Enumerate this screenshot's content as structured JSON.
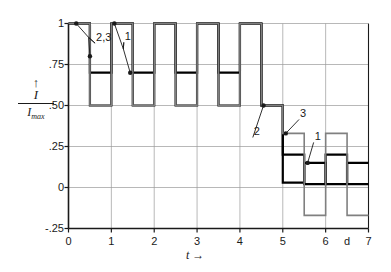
{
  "chart_data": {
    "type": "line",
    "title": "",
    "xlabel": "t",
    "ylabel": "I / Imax",
    "xlim": [
      0,
      7
    ],
    "ylim": [
      -0.25,
      1.0
    ],
    "grid": true,
    "legend": "none",
    "x_ticks": [
      "0",
      "1",
      "2",
      "3",
      "4",
      "5",
      "6",
      "7"
    ],
    "x_tick_values": [
      0,
      1,
      2,
      3,
      4,
      5,
      6,
      7
    ],
    "x_unit_label": "d",
    "x_unit_label_value": 6.5,
    "y_ticks": [
      "1",
      ".75",
      ".50",
      ".25",
      "0",
      "-.25"
    ],
    "y_tick_values": [
      1,
      0.75,
      0.5,
      0.25,
      0,
      -0.25
    ],
    "series": [
      {
        "name": "1",
        "color": "#000000",
        "width": 2.2,
        "points": [
          [
            0.0,
            1.0
          ],
          [
            0.5,
            1.0
          ],
          [
            0.5,
            0.7
          ],
          [
            1.0,
            0.7
          ],
          [
            1.0,
            1.0
          ],
          [
            1.5,
            1.0
          ],
          [
            1.5,
            0.7
          ],
          [
            2.0,
            0.7
          ],
          [
            2.0,
            1.0
          ],
          [
            2.5,
            1.0
          ],
          [
            2.5,
            0.7
          ],
          [
            3.0,
            0.7
          ],
          [
            3.0,
            1.0
          ],
          [
            3.5,
            1.0
          ],
          [
            3.5,
            0.7
          ],
          [
            4.0,
            0.7
          ],
          [
            4.0,
            1.0
          ],
          [
            4.5,
            1.0
          ],
          [
            4.5,
            0.5
          ],
          [
            5.0,
            0.5
          ],
          [
            5.0,
            0.03
          ],
          [
            5.5,
            0.03
          ],
          [
            5.5,
            0.15
          ],
          [
            6.0,
            0.15
          ],
          [
            6.0,
            0.02
          ],
          [
            6.5,
            0.02
          ],
          [
            6.5,
            0.15
          ],
          [
            7.0,
            0.15
          ]
        ]
      },
      {
        "name": "2",
        "color": "#000000",
        "width": 2.2,
        "points": [
          [
            0.0,
            1.0
          ],
          [
            0.5,
            1.0
          ],
          [
            0.5,
            0.5
          ],
          [
            1.0,
            0.5
          ],
          [
            1.0,
            1.0
          ],
          [
            1.5,
            1.0
          ],
          [
            1.5,
            0.5
          ],
          [
            2.0,
            0.5
          ],
          [
            2.0,
            1.0
          ],
          [
            2.5,
            1.0
          ],
          [
            2.5,
            0.5
          ],
          [
            3.0,
            0.5
          ],
          [
            3.0,
            1.0
          ],
          [
            3.5,
            1.0
          ],
          [
            3.5,
            0.5
          ],
          [
            4.0,
            0.5
          ],
          [
            4.0,
            1.0
          ],
          [
            4.5,
            1.0
          ],
          [
            4.5,
            0.5
          ],
          [
            5.0,
            0.5
          ],
          [
            5.0,
            0.2
          ],
          [
            5.5,
            0.2
          ],
          [
            5.5,
            0.02
          ],
          [
            6.0,
            0.02
          ],
          [
            6.0,
            0.2
          ],
          [
            6.5,
            0.2
          ],
          [
            6.5,
            0.02
          ],
          [
            7.0,
            0.02
          ]
        ]
      },
      {
        "name": "3",
        "color": "#808080",
        "width": 1.6,
        "points": [
          [
            0.0,
            1.0
          ],
          [
            0.5,
            1.0
          ],
          [
            0.5,
            0.5
          ],
          [
            1.0,
            0.5
          ],
          [
            1.0,
            1.0
          ],
          [
            1.5,
            1.0
          ],
          [
            1.5,
            0.5
          ],
          [
            2.0,
            0.5
          ],
          [
            2.0,
            1.0
          ],
          [
            2.5,
            1.0
          ],
          [
            2.5,
            0.5
          ],
          [
            3.0,
            0.5
          ],
          [
            3.0,
            1.0
          ],
          [
            3.5,
            1.0
          ],
          [
            3.5,
            0.5
          ],
          [
            4.0,
            0.5
          ],
          [
            4.0,
            1.0
          ],
          [
            4.5,
            1.0
          ],
          [
            4.5,
            0.5
          ],
          [
            5.0,
            0.5
          ],
          [
            5.0,
            0.33
          ],
          [
            5.5,
            0.33
          ],
          [
            5.5,
            -0.17
          ],
          [
            6.0,
            -0.17
          ],
          [
            6.0,
            0.33
          ],
          [
            6.5,
            0.33
          ],
          [
            6.5,
            -0.17
          ],
          [
            7.0,
            -0.17
          ]
        ]
      }
    ],
    "annotations": [
      {
        "label": "2,3",
        "label_x": 0.62,
        "label_y": 0.88,
        "markers": [
          [
            0.18,
            1.0
          ],
          [
            0.5,
            0.8
          ]
        ],
        "elbow": [
          0.47,
          0.915
        ]
      },
      {
        "label": "1",
        "label_x": 1.29,
        "label_y": 0.885,
        "markers": [
          [
            1.07,
            1.0
          ],
          [
            1.44,
            0.7
          ]
        ],
        "elbow": [
          1.28,
          0.845
        ]
      },
      {
        "label": "2",
        "label_x": 4.3,
        "label_y": 0.305,
        "markers": [
          [
            4.55,
            0.5
          ]
        ],
        "elbow": null
      },
      {
        "label": "3",
        "label_x": 5.38,
        "label_y": 0.415,
        "markers": [
          [
            5.07,
            0.33
          ]
        ],
        "elbow": null
      },
      {
        "label": "1",
        "label_x": 5.72,
        "label_y": 0.275,
        "markers": [
          [
            5.58,
            0.15
          ]
        ],
        "elbow": null
      }
    ],
    "colors": {
      "axis": "#1a1a1a",
      "grid": "#9a9a9a",
      "curve_black": "#000000",
      "curve_gray": "#808080",
      "background": "#ffffff"
    }
  }
}
